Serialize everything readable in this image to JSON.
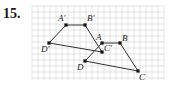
{
  "problem": {
    "number": "15."
  },
  "grid": {
    "x0": 32,
    "y0": 6,
    "x1": 164,
    "y1": 80,
    "step": 6,
    "color": "#d4d4d4"
  },
  "colors": {
    "line": "#333333",
    "point": "#111111"
  },
  "points": [
    {
      "id": "A_prime",
      "label": "A'",
      "x": 66,
      "y": 25,
      "lx": 58,
      "ly": 21
    },
    {
      "id": "B_prime",
      "label": "B'",
      "x": 85,
      "y": 25,
      "lx": 87,
      "ly": 21
    },
    {
      "id": "D_prime",
      "label": "D'",
      "x": 49,
      "y": 43,
      "lx": 41,
      "ly": 52
    },
    {
      "id": "A",
      "label": "A",
      "x": 102,
      "y": 43,
      "lx": 96,
      "ly": 40
    },
    {
      "id": "C_prime",
      "label": "C'",
      "x": 102,
      "y": 52,
      "lx": 104,
      "ly": 51
    },
    {
      "id": "B",
      "label": "B",
      "x": 120,
      "y": 43,
      "lx": 122,
      "ly": 41
    },
    {
      "id": "D",
      "label": "D",
      "x": 85,
      "y": 61,
      "lx": 77,
      "ly": 70
    },
    {
      "id": "C",
      "label": "C",
      "x": 138,
      "y": 71,
      "lx": 139,
      "ly": 80
    }
  ],
  "segments": [
    {
      "from": "A_prime",
      "to": "B_prime"
    },
    {
      "from": "B_prime",
      "to": "C_prime"
    },
    {
      "from": "C_prime",
      "to": "D_prime"
    },
    {
      "from": "D_prime",
      "to": "A_prime"
    },
    {
      "from": "A",
      "to": "B"
    },
    {
      "from": "B",
      "to": "C"
    },
    {
      "from": "C",
      "to": "D"
    },
    {
      "from": "D",
      "to": "A"
    }
  ]
}
